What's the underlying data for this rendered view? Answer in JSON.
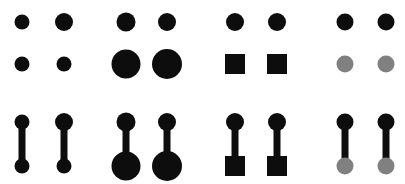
{
  "figure": {
    "width": 405,
    "height": 184,
    "background_color": "#ffffff"
  },
  "colors": {
    "black": "#0d0d0d",
    "gray": "#808080",
    "background": "#ffffff"
  },
  "rows": [
    {
      "id": "row-unconnected",
      "label": "unconnected node pairs",
      "has_edge": false,
      "top_cy": 22,
      "bottom_cy": 64
    },
    {
      "id": "row-connected",
      "label": "connected node pairs",
      "has_edge": true,
      "top_cy": 122,
      "bottom_cy": 166
    }
  ],
  "edge": {
    "color": "#0d0d0d",
    "width": 7
  },
  "groups": [
    {
      "id": "group-baseline",
      "label": "baseline equal nodes",
      "encoding": "none",
      "items": [
        {
          "id": "baseline-col-1",
          "cx": 22,
          "top": {
            "shape": "circle",
            "size": 15,
            "color": "#0d0d0d"
          },
          "bottom": {
            "shape": "circle",
            "size": 15,
            "color": "#0d0d0d"
          }
        },
        {
          "id": "baseline-col-2",
          "cx": 64,
          "top": {
            "shape": "circle",
            "size": 18,
            "color": "#0d0d0d"
          },
          "bottom": {
            "shape": "circle",
            "size": 15,
            "color": "#0d0d0d"
          }
        }
      ]
    },
    {
      "id": "group-size",
      "label": "size encoding",
      "encoding": "size",
      "items": [
        {
          "id": "size-col-1",
          "cx": 126,
          "top": {
            "shape": "circle",
            "size": 19,
            "color": "#0d0d0d"
          },
          "bottom": {
            "shape": "circle",
            "size": 29,
            "color": "#0d0d0d"
          }
        },
        {
          "id": "size-col-2",
          "cx": 167,
          "top": {
            "shape": "circle",
            "size": 18,
            "color": "#0d0d0d"
          },
          "bottom": {
            "shape": "circle",
            "size": 30,
            "color": "#0d0d0d"
          }
        }
      ]
    },
    {
      "id": "group-shape",
      "label": "shape encoding",
      "encoding": "shape",
      "items": [
        {
          "id": "shape-col-1",
          "cx": 235,
          "top": {
            "shape": "circle",
            "size": 18,
            "color": "#0d0d0d"
          },
          "bottom": {
            "shape": "square",
            "size": 20,
            "color": "#0d0d0d"
          }
        },
        {
          "id": "shape-col-2",
          "cx": 277,
          "top": {
            "shape": "circle",
            "size": 18,
            "color": "#0d0d0d"
          },
          "bottom": {
            "shape": "square",
            "size": 20,
            "color": "#0d0d0d"
          }
        }
      ]
    },
    {
      "id": "group-color",
      "label": "color encoding",
      "encoding": "color",
      "items": [
        {
          "id": "color-col-1",
          "cx": 345,
          "top": {
            "shape": "circle",
            "size": 17,
            "color": "#0d0d0d"
          },
          "bottom": {
            "shape": "circle",
            "size": 17,
            "color": "#808080"
          }
        },
        {
          "id": "color-col-2",
          "cx": 386,
          "top": {
            "shape": "circle",
            "size": 17,
            "color": "#0d0d0d"
          },
          "bottom": {
            "shape": "circle",
            "size": 17,
            "color": "#808080"
          }
        }
      ]
    }
  ]
}
